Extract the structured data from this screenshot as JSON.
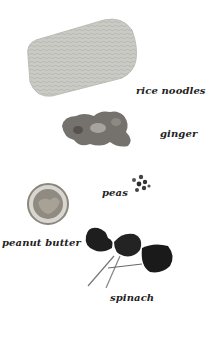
{
  "ingredients": [
    {
      "name": "rice noodles",
      "label": "rice noodles"
    },
    {
      "name": "ginger",
      "label": "ginger"
    },
    {
      "name": "peas",
      "label": "peas"
    },
    {
      "name": "peanut butter",
      "label": "peanut butter"
    },
    {
      "name": "spinach",
      "label": "spinach"
    }
  ],
  "colors": {
    "background": "#ffffff",
    "noodles": "#c8c8c4",
    "ginger": "#6e6a66",
    "peas": "#3a3a3a",
    "jar": "#9a9690",
    "spinach": "#1f1f1f",
    "label": "#222222"
  }
}
